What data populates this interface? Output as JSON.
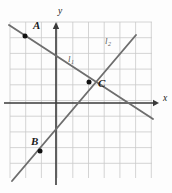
{
  "figure": {
    "kind": "coordinate-plane-diagram",
    "width": 172,
    "height": 193,
    "background_color": "#fdfdfd"
  },
  "grid": {
    "line_color": "#c9c9c9",
    "cell_size": 15.7,
    "left": 10,
    "top": 22,
    "right": 152,
    "bottom": 178,
    "columns": 9,
    "rows": 10,
    "visible": true
  },
  "axes": {
    "color": "#3a3a3a",
    "x_axis": {
      "label": "x",
      "label_x": 163,
      "label_y": 101,
      "y_pixel": 103,
      "start_x": 4,
      "end_x": 159,
      "arrow": "right"
    },
    "y_axis": {
      "label": "y",
      "label_x": 58,
      "label_y": 14,
      "x_pixel": 56,
      "start_y": 185,
      "end_y": 24,
      "arrow": "up"
    },
    "origin": {
      "x": 56,
      "y": 103
    }
  },
  "lines": [
    {
      "name": "l1",
      "label": "l",
      "subscript": "1",
      "label_x": 68,
      "label_y": 62,
      "color": "#6e6e6e",
      "x1": 9,
      "y1": 25,
      "x2": 153,
      "y2": 119,
      "direction": "descending",
      "slope": -0.65
    },
    {
      "name": "l2",
      "label": "l",
      "subscript": "2",
      "label_x": 105,
      "label_y": 44,
      "color": "#6e6e6e",
      "x1": 12,
      "y1": 181,
      "x2": 136,
      "y2": 35,
      "direction": "ascending",
      "slope": 1.18
    }
  ],
  "points": [
    {
      "label": "A",
      "x": 25,
      "y": 36,
      "label_x": 33,
      "label_y": 29,
      "on_line": "l1",
      "color": "#111111"
    },
    {
      "label": "B",
      "x": 40,
      "y": 151,
      "label_x": 31,
      "label_y": 145,
      "on_line": "l2",
      "color": "#111111"
    },
    {
      "label": "C",
      "x": 89,
      "y": 82,
      "label_x": 98,
      "label_y": 87,
      "on_line": "l1,l2",
      "color": "#111111"
    }
  ]
}
